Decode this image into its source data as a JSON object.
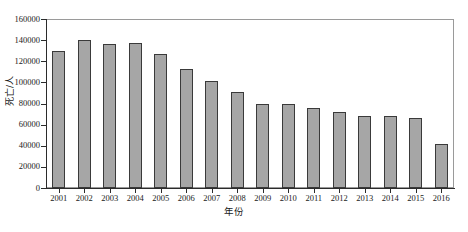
{
  "chart_data": {
    "type": "bar",
    "title": "",
    "subtitle": "",
    "xlabel": "年份",
    "ylabel": "死亡/人",
    "categories": [
      "2001",
      "2002",
      "2003",
      "2004",
      "2005",
      "2006",
      "2007",
      "2008",
      "2009",
      "2010",
      "2011",
      "2012",
      "2013",
      "2014",
      "2015",
      "2016"
    ],
    "values": [
      130000,
      140000,
      136000,
      137000,
      126500,
      112500,
      101000,
      91000,
      80000,
      79500,
      76000,
      72000,
      68500,
      68000,
      66000,
      41500
    ],
    "series": [
      {
        "name": "死亡/人",
        "values": [
          130000,
          140000,
          136000,
          137000,
          126500,
          112500,
          101000,
          91000,
          80000,
          79500,
          76000,
          72000,
          68500,
          68000,
          66000,
          41500
        ]
      }
    ],
    "ylim": [
      0,
      160000
    ],
    "ytick_step": 20000,
    "ytick_labels": [
      "0",
      "20000",
      "40000",
      "60000",
      "80000",
      "100000",
      "120000",
      "140000",
      "160000"
    ],
    "ytick_values": [
      0,
      20000,
      40000,
      60000,
      80000,
      100000,
      120000,
      140000,
      160000
    ],
    "xtick_labels": [
      "2001",
      "2002",
      "2003",
      "2004",
      "2005",
      "2006",
      "2007",
      "2008",
      "2009",
      "2010",
      "2011",
      "2012",
      "2013",
      "2014",
      "2015",
      "2016"
    ],
    "grid": false,
    "legend": false,
    "legend_position": "none",
    "bar_fill_color": "#a6a6a6",
    "bar_edge_color": "#3a3a3a",
    "axis_color": "#2b2b2b",
    "frame_color": "#9a9a9a",
    "background_color": "#ffffff"
  }
}
